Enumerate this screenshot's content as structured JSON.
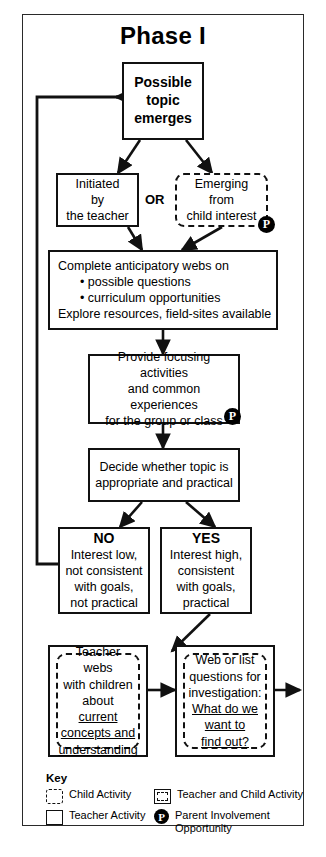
{
  "page": {
    "title": "Phase I"
  },
  "nodes": {
    "topic": {
      "id": "possible-topic",
      "text_lines": [
        "Possible",
        "topic",
        "emerges"
      ],
      "style": "teacher"
    },
    "initiated": {
      "id": "initiated-by-teacher",
      "text_lines": [
        "Initiated",
        "by",
        "the teacher"
      ],
      "style": "teacher"
    },
    "or_label": "OR",
    "emerging": {
      "id": "emerging-from-child-interest",
      "text_lines": [
        "Emerging",
        "from",
        "child interest"
      ],
      "style": "child"
    },
    "webs": {
      "id": "complete-anticipatory-webs",
      "line1": "Complete anticipatory webs on",
      "bullet1": "• possible questions",
      "bullet2": "• curriculum opportunities",
      "line4": "Explore resources, field-sites available",
      "style": "teacher"
    },
    "focusing": {
      "id": "provide-focusing-activities",
      "text_lines": [
        "Provide focusing activities",
        "and common experiences",
        "for the group or class"
      ],
      "style": "teacher"
    },
    "decide": {
      "id": "decide-whether-topic",
      "text_lines": [
        "Decide whether topic is",
        "appropriate and practical"
      ],
      "style": "teacher"
    },
    "no": {
      "id": "no-branch",
      "heading": "NO",
      "text_lines": [
        "Interest low,",
        "not consistent",
        "with goals,",
        "not practical"
      ],
      "style": "teacher"
    },
    "yes": {
      "id": "yes-branch",
      "heading": "YES",
      "text_lines": [
        "Interest high,",
        "consistent",
        "with goals,",
        "practical"
      ],
      "style": "teacher"
    },
    "teacher_webs": {
      "id": "teacher-webs-with-children",
      "plain_lines": [
        "Teacher webs",
        "with children",
        "about"
      ],
      "underlined_lines": [
        "current",
        "concepts and",
        "understanding"
      ],
      "style": "teacher-and-child"
    },
    "web_list": {
      "id": "web-or-list-questions",
      "plain_lines": [
        "Web or list",
        "questions for",
        "investigation:"
      ],
      "underlined_lines": [
        "What do we",
        "want to",
        "find out?"
      ],
      "style": "teacher-and-child"
    }
  },
  "badges": {
    "parent_letter": "P",
    "count": 2
  },
  "key": {
    "title": "Key",
    "items": [
      {
        "icon": "dashed-square-icon",
        "label": "Child Activity"
      },
      {
        "icon": "solid-square-with-dashed-inner-icon",
        "label": "Teacher and Child Activity"
      },
      {
        "icon": "solid-square-icon",
        "label": "Teacher Activity"
      },
      {
        "icon": "parent-circle-p-icon",
        "label_line1": "Parent Involvement",
        "label_line2": "Opportunity"
      }
    ]
  },
  "colors": {
    "stroke": "#111111",
    "badge_fill": "#000000",
    "background": "#ffffff",
    "frame_border": "#2a2a2a"
  },
  "flow": {
    "edges": [
      {
        "from": "possible-topic",
        "to": "initiated-by-teacher"
      },
      {
        "from": "possible-topic",
        "to": "emerging-from-child-interest"
      },
      {
        "from": "initiated-by-teacher",
        "to": "complete-anticipatory-webs"
      },
      {
        "from": "emerging-from-child-interest",
        "to": "complete-anticipatory-webs"
      },
      {
        "from": "complete-anticipatory-webs",
        "to": "provide-focusing-activities"
      },
      {
        "from": "provide-focusing-activities",
        "to": "decide-whether-topic"
      },
      {
        "from": "decide-whether-topic",
        "to": "no-branch"
      },
      {
        "from": "decide-whether-topic",
        "to": "yes-branch"
      },
      {
        "from": "no-branch",
        "to": "possible-topic",
        "kind": "feedback-loop"
      },
      {
        "from": "yes-branch",
        "to": "teacher-webs-with-children"
      },
      {
        "from": "teacher-webs-with-children",
        "to": "web-or-list-questions"
      },
      {
        "from": "web-or-list-questions",
        "to": "next-phase",
        "kind": "exit"
      }
    ]
  }
}
